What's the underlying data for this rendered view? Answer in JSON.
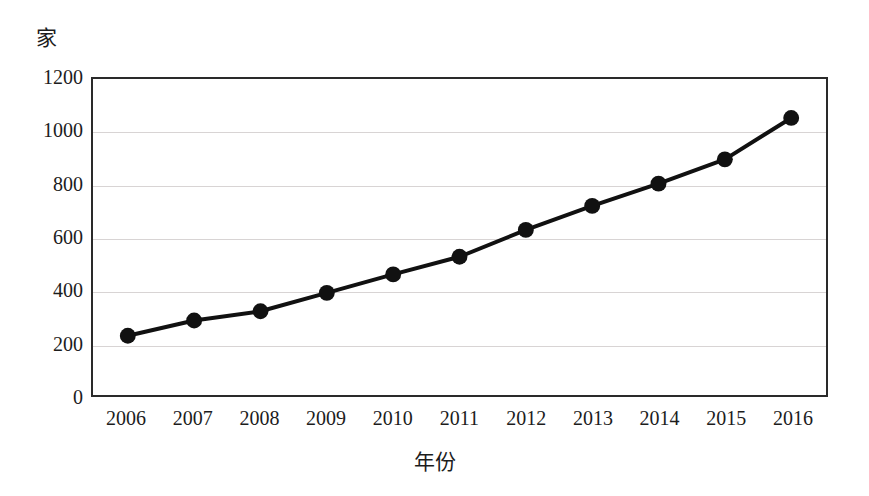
{
  "chart_data": {
    "type": "line",
    "title": "",
    "subtitle": "",
    "xlabel": "年份",
    "ylabel": "家",
    "y_unit_label": "家",
    "categories": [
      "2006",
      "2007",
      "2008",
      "2009",
      "2010",
      "2011",
      "2012",
      "2013",
      "2014",
      "2015",
      "2016"
    ],
    "x": [
      2006,
      2007,
      2008,
      2009,
      2010,
      2011,
      2012,
      2013,
      2014,
      2015,
      2016
    ],
    "values": [
      225,
      283,
      318,
      388,
      458,
      525,
      627,
      718,
      803,
      895,
      1052
    ],
    "series": [
      {
        "name": "",
        "values": [
          225,
          283,
          318,
          388,
          458,
          525,
          627,
          718,
          803,
          895,
          1052
        ]
      }
    ],
    "ylim": [
      0,
      1200
    ],
    "yticks": [
      0,
      200,
      400,
      600,
      800,
      1000,
      1200
    ],
    "ytick_labels": [
      "0",
      "200",
      "400",
      "600",
      "800",
      "1000",
      "1200"
    ],
    "xtick_labels": [
      "2006",
      "2007",
      "2008",
      "2009",
      "2010",
      "2011",
      "2012",
      "2013",
      "2014",
      "2015",
      "2016"
    ],
    "grid": true,
    "grid_axis": "y",
    "legend": false,
    "legend_position": "none",
    "marker": "filled-circle",
    "line_color": "#111111",
    "marker_color": "#111111",
    "grid_color": "#d8d4d4",
    "frame_color": "#2a2a2a",
    "background_color": "#ffffff",
    "annotations": []
  }
}
